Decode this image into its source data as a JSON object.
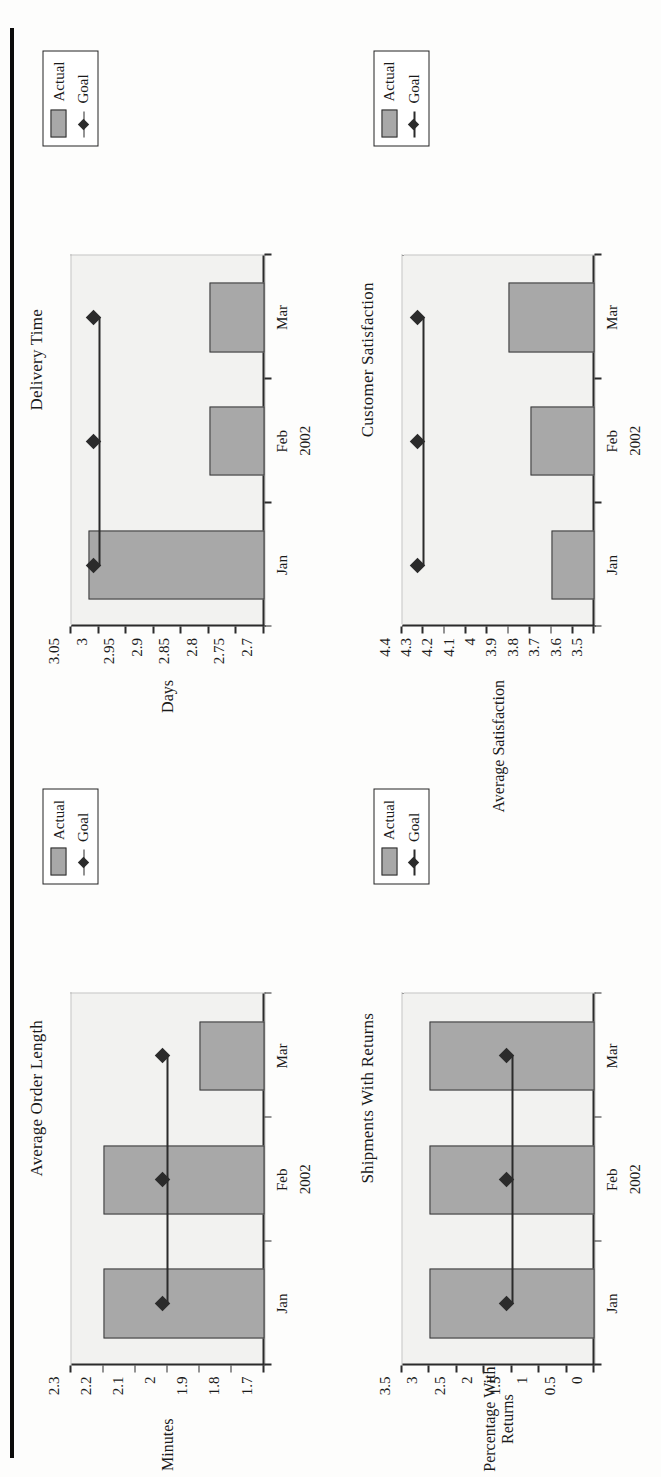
{
  "page": {
    "orientation": "landscape-content-rotated-90ccw",
    "charts": [
      {
        "id": "average-order-length",
        "title": "Average Order Length",
        "ylabel": "Minutes",
        "xgroup": "2002",
        "legend": {
          "actual": "Actual",
          "goal": "Goal"
        }
      },
      {
        "id": "delivery-time",
        "title": "Delivery Time",
        "ylabel": "Days",
        "xgroup": "2002",
        "legend": {
          "actual": "Actual",
          "goal": "Goal"
        }
      },
      {
        "id": "shipments-with-returns",
        "title": "Shipments With Returns",
        "ylabel": "Percentage With\nReturns",
        "xgroup": "2002",
        "legend": {
          "actual": "Actual",
          "goal": "Goal"
        }
      },
      {
        "id": "customer-satisfaction",
        "title": "Customer Satisfaction",
        "ylabel": "Average Satisfaction",
        "xgroup": "2002",
        "legend": {
          "actual": "Actual",
          "goal": "Goal"
        }
      }
    ]
  },
  "chart_data": [
    {
      "type": "bar",
      "id": "average-order-length",
      "title": "Average Order Length",
      "xlabel": "2002",
      "ylabel": "Minutes",
      "categories": [
        "Jan",
        "Feb",
        "Mar"
      ],
      "ylim": [
        1.7,
        2.3
      ],
      "yticks": [
        2.3,
        2.2,
        2.1,
        2,
        1.9,
        1.8,
        1.7
      ],
      "ytick_labels": [
        "2.3",
        "2.2",
        "2.1",
        "2",
        "1.9",
        "1.8",
        "1.7"
      ],
      "grid": false,
      "legend_position": "top-right",
      "series": [
        {
          "name": "Actual",
          "type": "bar",
          "values": [
            2.2,
            2.2,
            1.9
          ]
        },
        {
          "name": "Goal",
          "type": "line",
          "values": [
            2,
            2,
            2
          ]
        }
      ]
    },
    {
      "type": "bar",
      "id": "delivery-time",
      "title": "Delivery Time",
      "xlabel": "2002",
      "ylabel": "Days",
      "categories": [
        "Jan",
        "Feb",
        "Mar"
      ],
      "ylim": [
        2.7,
        3.05
      ],
      "yticks": [
        3.05,
        3,
        2.95,
        2.9,
        2.85,
        2.8,
        2.75,
        2.7
      ],
      "ytick_labels": [
        "3.05",
        "3",
        "2.95",
        "2.9",
        "2.85",
        "2.8",
        "2.75",
        "2.7"
      ],
      "grid": false,
      "legend_position": "top-right",
      "series": [
        {
          "name": "Actual",
          "type": "bar",
          "values": [
            3.02,
            2.8,
            2.8
          ]
        },
        {
          "name": "Goal",
          "type": "line",
          "values": [
            3,
            3,
            3
          ]
        }
      ]
    },
    {
      "type": "bar",
      "id": "shipments-with-returns",
      "title": "Shipments With Returns",
      "xlabel": "2002",
      "ylabel": "Percentage With Returns",
      "categories": [
        "Jan",
        "Feb",
        "Mar"
      ],
      "ylim": [
        0,
        3.5
      ],
      "yticks": [
        3.5,
        3,
        2.5,
        2,
        1.5,
        1,
        0.5,
        0
      ],
      "ytick_labels": [
        "3.5",
        "3",
        "2.5",
        "2",
        "1.5",
        "1",
        "0.5",
        "0"
      ],
      "grid": false,
      "legend_position": "top-right",
      "series": [
        {
          "name": "Actual",
          "type": "bar",
          "values": [
            3,
            3,
            3
          ]
        },
        {
          "name": "Goal",
          "type": "line",
          "values": [
            1.5,
            1.5,
            1.5
          ]
        }
      ]
    },
    {
      "type": "bar",
      "id": "customer-satisfaction",
      "title": "Customer Satisfaction",
      "xlabel": "2002",
      "ylabel": "Average Satisfaction",
      "categories": [
        "Jan",
        "Feb",
        "Mar"
      ],
      "ylim": [
        3.5,
        4.4
      ],
      "yticks": [
        4.4,
        4.3,
        4.2,
        4.1,
        4,
        3.9,
        3.8,
        3.7,
        3.6,
        3.5
      ],
      "ytick_labels": [
        "4.4",
        "4.3",
        "4.2",
        "4.1",
        "4",
        "3.9",
        "3.8",
        "3.7",
        "3.6",
        "3.5"
      ],
      "grid": false,
      "legend_position": "top-right",
      "series": [
        {
          "name": "Actual",
          "type": "bar",
          "values": [
            3.7,
            3.8,
            3.9
          ]
        },
        {
          "name": "Goal",
          "type": "line",
          "values": [
            4.3,
            4.3,
            4.3
          ]
        }
      ]
    }
  ]
}
